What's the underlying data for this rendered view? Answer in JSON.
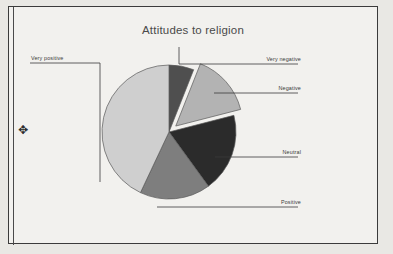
{
  "figure": {
    "title": "Attitudes to religion",
    "frame_border_color": "#3b3b3b",
    "background_color": "#f2f1ee",
    "drag_handle_glyph": "✥"
  },
  "chart_data": {
    "type": "pie",
    "title": "Attitudes to religion",
    "xlabel": "",
    "ylabel": "",
    "legend_position": "callout-labels",
    "grid": false,
    "start_angle_deg": 0,
    "direction": "clockwise",
    "categories": [
      "Very negative",
      "Negative",
      "Neutral",
      "Positive",
      "Very positive"
    ],
    "values": [
      6,
      15,
      19,
      17,
      43
    ],
    "angles_deg": [
      21.6,
      54.0,
      68.4,
      61.2,
      154.8
    ],
    "colors": [
      "#4f4f4f",
      "#b3b3b3",
      "#2b2b2b",
      "#7e7e7e",
      "#cfcfcf"
    ],
    "exploded": [
      false,
      true,
      false,
      false,
      false
    ],
    "slices": [
      {
        "label": "Very negative",
        "value": 6,
        "angle_deg": 21.6,
        "color": "#4f4f4f",
        "exploded": false
      },
      {
        "label": "Negative",
        "value": 15,
        "angle_deg": 54.0,
        "color": "#b3b3b3",
        "exploded": true
      },
      {
        "label": "Neutral",
        "value": 19,
        "angle_deg": 68.4,
        "color": "#2b2b2b",
        "exploded": false
      },
      {
        "label": "Positive",
        "value": 17,
        "angle_deg": 61.2,
        "color": "#7e7e7e",
        "exploded": false
      },
      {
        "label": "Very positive",
        "value": 43,
        "angle_deg": 154.8,
        "color": "#cfcfcf",
        "exploded": false
      }
    ]
  },
  "labels": {
    "very_negative": "Very negative",
    "negative": "Negative",
    "neutral": "Neutral",
    "positive": "Positive",
    "very_positive": "Very positive"
  },
  "page_bleed": {
    "lines": [
      {
        "text": "bers to wh",
        "x": 236,
        "y": 14,
        "size": 15
      },
      {
        "text": "mmitte",
        "x": 250,
        "y": 36,
        "size": 14
      },
      {
        "text": "ommittee",
        "x": 232,
        "y": 54,
        "size": 13
      },
      {
        "text": "to oppose",
        "x": 236,
        "y": 72,
        "size": 12
      },
      {
        "text": "w to make a formal",
        "x": 200,
        "y": 108,
        "size": 14
      },
      {
        "text": "ittee to a proced",
        "x": 214,
        "y": 128,
        "size": 12
      },
      {
        "text": "fill in and ret",
        "x": 232,
        "y": 148,
        "size": 12
      },
      {
        "text": "the opportu",
        "x": 246,
        "y": 166,
        "size": 12
      },
      {
        "text": "ach rou",
        "x": 256,
        "y": 204,
        "size": 13
      },
      {
        "text": "nd the num",
        "x": 240,
        "y": 226,
        "size": 12
      }
    ]
  }
}
